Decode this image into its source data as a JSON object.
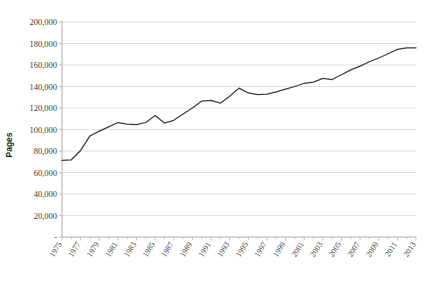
{
  "chart_data": {
    "type": "line",
    "title": "",
    "xlabel": "",
    "ylabel": "Pages",
    "ylim": [
      0,
      200000
    ],
    "xlim": [
      1975,
      2013
    ],
    "grid": true,
    "legend": false,
    "legend_position": "none",
    "y_tick_labels": [
      "200,000",
      "180,000",
      "160,000",
      "140,000",
      "120,000",
      "100,000",
      "80,000",
      "60,000",
      "40,000",
      "20,000",
      "-"
    ],
    "y_tick_values": [
      200000,
      180000,
      160000,
      140000,
      120000,
      100000,
      80000,
      60000,
      40000,
      20000,
      0
    ],
    "x_tick_labels": [
      "1975",
      "1977",
      "1979",
      "1981",
      "1983",
      "1985",
      "1987",
      "1989",
      "1991",
      "1993",
      "1995",
      "1997",
      "1999",
      "2001",
      "2003",
      "2005",
      "2007",
      "2009",
      "2011",
      "2013"
    ],
    "x_minor_ticks_every_year": true,
    "series": [
      {
        "name": "Pages",
        "color": "#3d3d3d",
        "x": [
          1975,
          1976,
          1977,
          1978,
          1979,
          1980,
          1981,
          1982,
          1983,
          1984,
          1985,
          1986,
          1987,
          1988,
          1989,
          1990,
          1991,
          1992,
          1993,
          1994,
          1995,
          1996,
          1997,
          1998,
          1999,
          2000,
          2001,
          2002,
          2003,
          2004,
          2005,
          2006,
          2007,
          2008,
          2009,
          2010,
          2011,
          2012,
          2013
        ],
        "values": [
          71200,
          71800,
          80500,
          94000,
          98500,
          102500,
          106500,
          105000,
          104500,
          106500,
          113000,
          106000,
          108500,
          114500,
          120000,
          126500,
          127000,
          124500,
          131000,
          138500,
          134000,
          132500,
          133000,
          135000,
          137500,
          140000,
          143000,
          144000,
          147500,
          146500,
          151000,
          155500,
          159000,
          163000,
          166500,
          170500,
          174500,
          176000,
          176000
        ]
      }
    ]
  },
  "axis": {
    "y_title": "Pages"
  }
}
